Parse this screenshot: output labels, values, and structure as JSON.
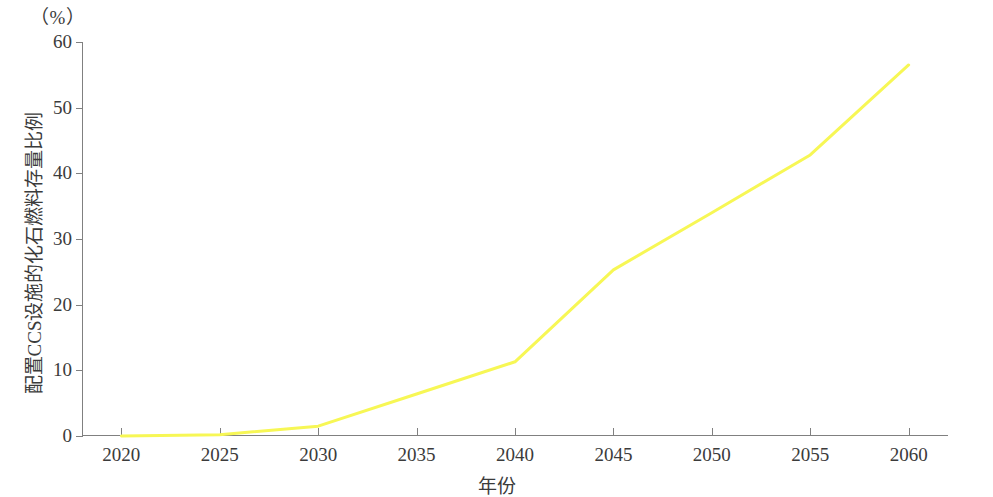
{
  "chart_data": {
    "type": "line",
    "title": "",
    "subtitle": "",
    "unit_label": "（%）",
    "xlabel": "年份",
    "ylabel": "配置CCS设施的化石燃料存量比例",
    "x": [
      2020,
      2025,
      2030,
      2035,
      2040,
      2045,
      2050,
      2055,
      2060
    ],
    "xticks": [
      "2020",
      "2025",
      "2030",
      "2035",
      "2040",
      "2045",
      "2050",
      "2055",
      "2060"
    ],
    "yticks": [
      "0",
      "10",
      "20",
      "30",
      "40",
      "50",
      "60"
    ],
    "ytick_values": [
      0,
      10,
      20,
      30,
      40,
      50,
      60
    ],
    "xlim": [
      2018,
      2062
    ],
    "ylim": [
      0,
      60
    ],
    "grid": false,
    "legend": null,
    "series": [
      {
        "name": "配置CCS设施的化石燃料存量比例",
        "color": "#f7f755",
        "values": [
          0.0,
          0.2,
          1.5,
          6.4,
          11.3,
          25.3,
          34.0,
          42.8,
          56.5
        ]
      }
    ]
  },
  "axes": {
    "spine_color": "#808080",
    "text_color": "#3b3b3b"
  }
}
